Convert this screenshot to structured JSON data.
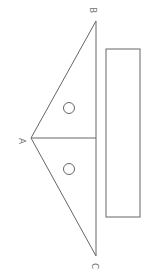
{
  "diagram": {
    "stroke_color": "#666666",
    "labels": {
      "apex": "A",
      "top_vertex": "B",
      "bottom_vertex": "C"
    },
    "marks": [
      "○",
      "○"
    ]
  }
}
